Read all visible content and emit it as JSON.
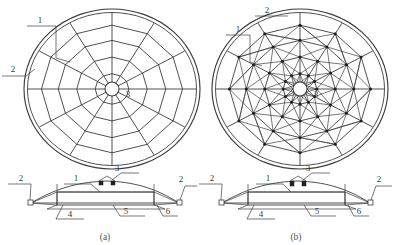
{
  "figure": {
    "domain_type": "engineering-drawing",
    "line_color": "#3c3c3c",
    "node_color": "#1d1d1d",
    "background": "#ffffff"
  },
  "panels": [
    {
      "id": "a",
      "caption": "(a)",
      "plan": {
        "center_x": 112,
        "center_y": 89,
        "outer_radius_x": 88,
        "outer_radius_y": 80,
        "outer_ring_count": 2,
        "spokes": 12,
        "rings": 4,
        "ring_radii_fraction": [
          0.2,
          0.42,
          0.64,
          0.84
        ],
        "hub_radius": 7,
        "bracing": "none",
        "labels": [
          {
            "text": "1",
            "x": 40,
            "y": 22
          },
          {
            "text": "2",
            "x": 12,
            "y": 71
          },
          {
            "text": "3",
            "x": 128,
            "y": 94
          }
        ]
      },
      "elevation": {
        "labels": [
          {
            "text": "1",
            "x": 76,
            "y": 180
          },
          {
            "text": "2",
            "x": 21,
            "y": 180
          },
          {
            "text": "2",
            "x": 181,
            "y": 180
          },
          {
            "text": "3",
            "x": 116,
            "y": 178
          },
          {
            "text": "4",
            "x": 69,
            "y": 218
          },
          {
            "text": "5",
            "x": 125,
            "y": 215
          },
          {
            "text": "6",
            "x": 167,
            "y": 215
          }
        ]
      }
    },
    {
      "id": "b",
      "caption": "(b)",
      "plan": {
        "center_x": 300,
        "center_y": 89,
        "outer_radius_x": 88,
        "outer_radius_y": 80,
        "outer_ring_count": 2,
        "spokes": 12,
        "rings": 4,
        "ring_radii_fraction": [
          0.2,
          0.42,
          0.64,
          0.84
        ],
        "hub_radius": 7,
        "bracing": "diagonal star lattice",
        "labels": [
          {
            "text": "1",
            "x": 238,
            "y": 31
          },
          {
            "text": "2",
            "x": 266,
            "y": 12
          },
          {
            "text": "3",
            "x": 316,
            "y": 94
          }
        ]
      },
      "elevation": {
        "labels": [
          {
            "text": "1",
            "x": 268,
            "y": 180
          },
          {
            "text": "2",
            "x": 212,
            "y": 180
          },
          {
            "text": "2",
            "x": 379,
            "y": 180
          },
          {
            "text": "3",
            "x": 307,
            "y": 178
          },
          {
            "text": "4",
            "x": 260,
            "y": 218
          },
          {
            "text": "5",
            "x": 316,
            "y": 215
          },
          {
            "text": "6",
            "x": 359,
            "y": 215
          }
        ]
      }
    }
  ],
  "callouts": {
    "1": "1",
    "2": "2",
    "3": "3",
    "4": "4",
    "5": "5",
    "6": "6"
  },
  "captions": {
    "a": "(a)",
    "b": "(b)"
  }
}
